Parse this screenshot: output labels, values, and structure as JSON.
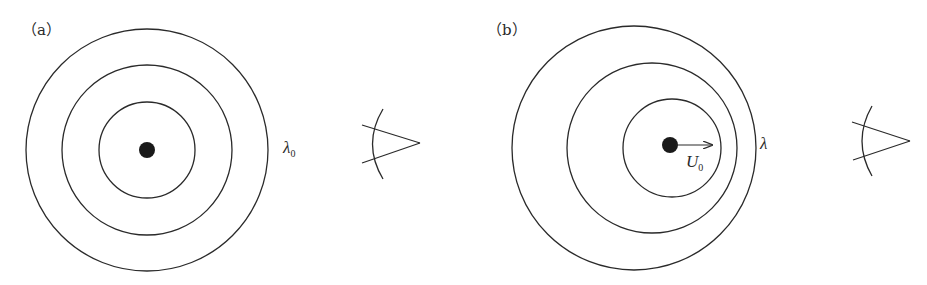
{
  "panels": [
    {
      "id": "a",
      "label": "（a）",
      "description": "Stationary source: concentric wavefronts",
      "wavelength_label": "λ",
      "wavelength_subscript": "0",
      "source": {
        "cx": 147,
        "cy": 150,
        "r": 8
      },
      "circles": [
        {
          "cx": 147,
          "cy": 150,
          "r": 48
        },
        {
          "cx": 147,
          "cy": 150,
          "r": 85
        },
        {
          "cx": 147,
          "cy": 150,
          "r": 121
        }
      ],
      "observer": {
        "arc": "M383,109 Q362,144 383,179",
        "line1": "M362,125 L420,143",
        "line2": "M362,163 L420,143"
      }
    },
    {
      "id": "b",
      "label": "（b）",
      "description": "Moving source: wavefronts compressed in direction of motion",
      "wavelength_label": "λ",
      "velocity_label": "U",
      "velocity_subscript": "0",
      "source": {
        "cx": 670,
        "cy": 145,
        "r": 8
      },
      "velocity_arrow": {
        "x1": 676,
        "y1": 145,
        "x2": 712,
        "y2": 145
      },
      "circles": [
        {
          "cx": 672,
          "cy": 148,
          "r": 49
        },
        {
          "cx": 652,
          "cy": 148,
          "r": 85
        },
        {
          "cx": 634,
          "cy": 148,
          "r": 122
        }
      ],
      "observer": {
        "arc": "M872,106 Q852,141 872,176",
        "line1": "M852,122 L910,141",
        "line2": "M853,160 L910,141"
      }
    }
  ],
  "colors": {
    "stroke": "#2a2a2a",
    "fill": "#1a1a1a",
    "background": "#ffffff"
  }
}
